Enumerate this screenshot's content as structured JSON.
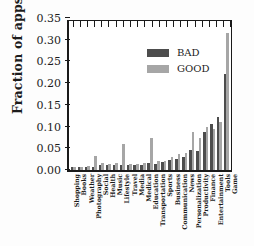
{
  "chart_data": {
    "type": "bar",
    "title": "",
    "xlabel": "",
    "ylabel": "Fraction of apps",
    "ylim": [
      0,
      0.35
    ],
    "ytick_labels": [
      "0.00",
      "0.05",
      "0.10",
      "0.15",
      "0.20",
      "0.25",
      "0.30",
      "0.35"
    ],
    "ytick_values": [
      0,
      0.05,
      0.1,
      0.15,
      0.2,
      0.25,
      0.3,
      0.35
    ],
    "grid": false,
    "legend_position": "upper left",
    "categories": [
      "Shopping",
      "Books",
      "Weather",
      "Photography",
      "Social",
      "Health",
      "Music",
      "Lifestyle",
      "Travel",
      "Media",
      "Medical",
      "Education",
      "Transportation",
      "Sports",
      "Business",
      "Communication",
      "News",
      "Personalization",
      "Productivity",
      "Finance",
      "Entertainment",
      "Tools",
      "Game"
    ],
    "series": [
      {
        "name": "BAD",
        "color": "#4d4d4d",
        "values": [
          0.006,
          0.006,
          0.006,
          0.008,
          0.012,
          0.012,
          0.012,
          0.012,
          0.012,
          0.011,
          0.012,
          0.016,
          0.013,
          0.018,
          0.022,
          0.026,
          0.03,
          0.047,
          0.044,
          0.088,
          0.107,
          0.122,
          0.22
        ]
      },
      {
        "name": "GOOD",
        "color": "#a6a6a6",
        "values": [
          0.006,
          0.008,
          0.01,
          0.032,
          0.016,
          0.013,
          0.017,
          0.06,
          0.015,
          0.014,
          0.016,
          0.073,
          0.021,
          0.021,
          0.029,
          0.036,
          0.04,
          0.087,
          0.073,
          0.1,
          0.095,
          0.11,
          0.315
        ]
      }
    ]
  },
  "legend": {
    "items": [
      {
        "label": "BAD",
        "key": "bad"
      },
      {
        "label": "GOOD",
        "key": "good"
      }
    ]
  }
}
